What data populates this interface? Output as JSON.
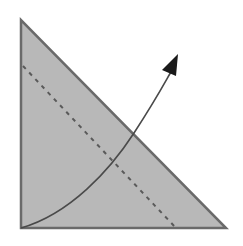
{
  "diagram": {
    "type": "geometric-figure",
    "colors": {
      "background": "#ffffff",
      "triangle_fill": "#b8b8b8",
      "triangle_stroke": "#6a6a6a",
      "dashed_line": "#5a5a5a",
      "curve": "#4a4a4a",
      "arrowhead": "#1a1a1a"
    },
    "triangle": {
      "vertices": [
        [
          21,
          20
        ],
        [
          21,
          228
        ],
        [
          226,
          228
        ]
      ]
    },
    "dashed_line": {
      "from": [
        23,
        66
      ],
      "to": [
        176,
        228
      ]
    },
    "curve_arrow": {
      "start": [
        21,
        228
      ],
      "control1": [
        80,
        210
      ],
      "control2": [
        110,
        160
      ],
      "mid": [
        134,
        133
      ],
      "end": [
        172,
        68
      ],
      "tip": [
        178,
        55
      ]
    }
  }
}
